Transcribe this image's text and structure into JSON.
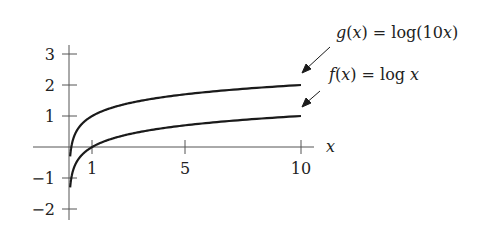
{
  "chart_data": {
    "type": "line",
    "title": "",
    "xlabel": "x",
    "ylabel": "",
    "xlim": [
      -1.55,
      10.5
    ],
    "ylim": [
      -2.3,
      3.2
    ],
    "grid": false,
    "legend": "annotations with arrows at right end of curves",
    "x_ticks": [
      1,
      5,
      10
    ],
    "x_tick_labels": [
      "1",
      "5",
      "10"
    ],
    "y_ticks": [
      -2,
      -1,
      1,
      2,
      3
    ],
    "y_tick_labels": [
      "−2",
      "−1",
      "1",
      "2",
      "3"
    ],
    "series": [
      {
        "name": "g(x) = log(10x)",
        "label": "g(x) = log(10x)",
        "x_range": [
          0.05,
          10
        ],
        "x": [
          0.05,
          0.1,
          0.5,
          1,
          2,
          5,
          10
        ],
        "values": [
          -0.301,
          0,
          0.699,
          1,
          1.301,
          1.699,
          2
        ]
      },
      {
        "name": "f(x) = log x",
        "label": "f(x) = log x",
        "x_range": [
          0.05,
          10
        ],
        "x": [
          0.05,
          0.1,
          0.5,
          1,
          2,
          5,
          10
        ],
        "values": [
          -1.301,
          -1,
          -0.301,
          0,
          0.301,
          0.699,
          1
        ]
      }
    ],
    "annotations": [
      {
        "text": "g(x) = log(10x)",
        "points_to": "g curve at x=10"
      },
      {
        "text": "f(x) = log x",
        "points_to": "f curve at x=10"
      }
    ]
  },
  "labels": {
    "x_axis": "x",
    "x_ticks": [
      "1",
      "5",
      "10"
    ],
    "y_ticks": [
      "3",
      "2",
      "1",
      "−1",
      "−2"
    ],
    "g_label": {
      "name": "g",
      "eq": " = log(10",
      "close": ")"
    },
    "f_label": {
      "name": "f",
      "eq": " = log "
    }
  },
  "colors": {
    "axis": "#555555",
    "curve": "#1a1a1a",
    "text": "#222222"
  }
}
